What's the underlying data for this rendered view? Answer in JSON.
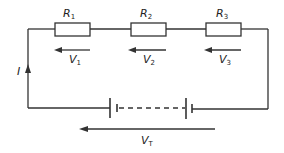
{
  "diagram": {
    "type": "series-circuit",
    "resistors": [
      {
        "id": "R1",
        "symbol": "R",
        "subscript": "1"
      },
      {
        "id": "R2",
        "symbol": "R",
        "subscript": "2"
      },
      {
        "id": "R3",
        "symbol": "R",
        "subscript": "3"
      }
    ],
    "voltages": [
      {
        "id": "V1",
        "symbol": "V",
        "subscript": "1"
      },
      {
        "id": "V2",
        "symbol": "V",
        "subscript": "2"
      },
      {
        "id": "V3",
        "symbol": "V",
        "subscript": "3"
      }
    ],
    "total_voltage": {
      "symbol": "V",
      "subscript": "T"
    },
    "current": {
      "symbol": "I"
    },
    "battery": {
      "cells": 2,
      "dashed_link": true
    },
    "colors": {
      "line": "#333333",
      "background": "#ffffff"
    }
  }
}
